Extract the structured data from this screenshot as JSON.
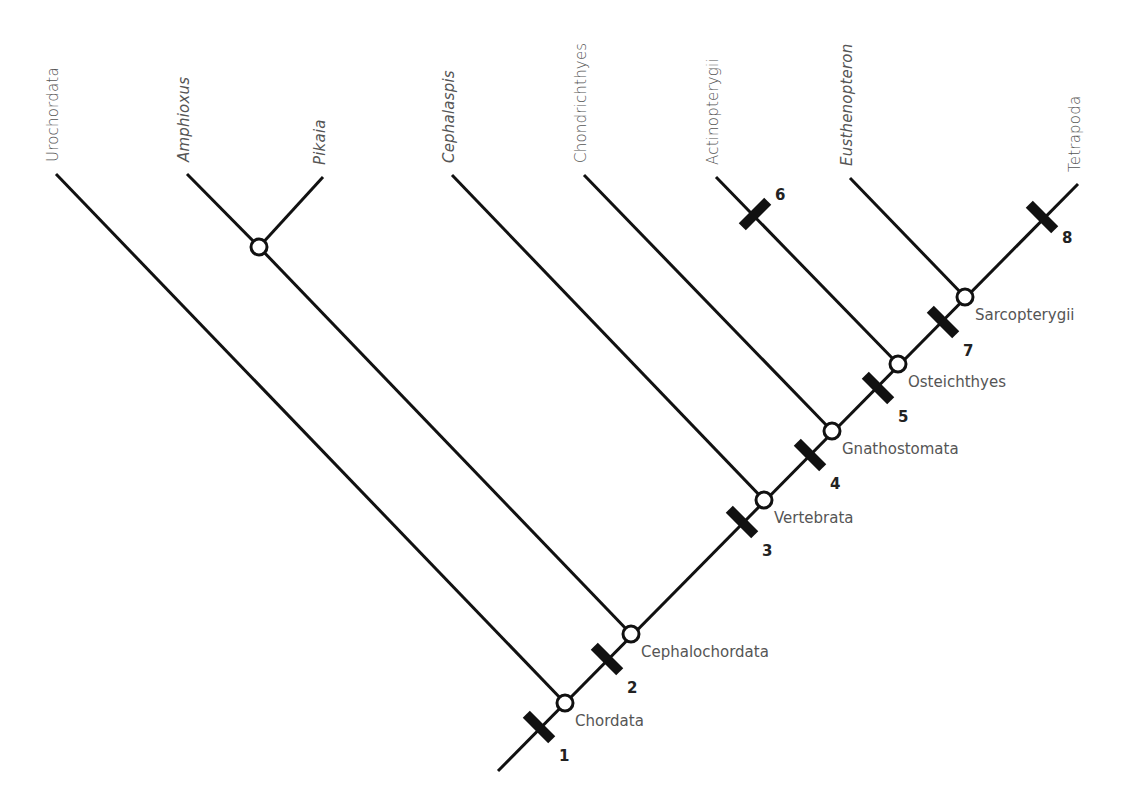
{
  "diagram": {
    "type": "cladogram",
    "taxa": [
      {
        "label": "Urochordata",
        "italic": false,
        "tip": [
          56,
          174
        ]
      },
      {
        "label": "Amphioxus",
        "italic": true,
        "tip": [
          187,
          174
        ]
      },
      {
        "label": "Pikaia",
        "italic": true,
        "tip": [
          323,
          177
        ]
      },
      {
        "label": "Cephalaspis",
        "italic": true,
        "tip": [
          452,
          175
        ]
      },
      {
        "label": "Chondrichthyes",
        "italic": false,
        "tip": [
          584,
          175
        ]
      },
      {
        "label": "Actinopterygii",
        "italic": false,
        "tip": [
          716,
          177
        ]
      },
      {
        "label": "Eusthenopteron",
        "italic": true,
        "tip": [
          850,
          178
        ]
      },
      {
        "label": "Tetrapoda",
        "italic": false,
        "tip": [
          1078,
          184
        ]
      }
    ],
    "root": [
      498,
      771
    ],
    "nodes": [
      {
        "label": "Chordata",
        "pos": [
          565,
          703
        ]
      },
      {
        "label": "Cephalochordata",
        "pos": [
          631,
          634
        ]
      },
      {
        "label": "Vertebrata",
        "pos": [
          764,
          500
        ]
      },
      {
        "label": "Gnathostomata",
        "pos": [
          832,
          431
        ]
      },
      {
        "label": "Osteichthyes",
        "pos": [
          898,
          364
        ]
      },
      {
        "label": "Sarcopterygii",
        "pos": [
          965,
          297
        ]
      }
    ],
    "side_node": {
      "pos": [
        259,
        247
      ]
    },
    "characters": [
      {
        "number": "1",
        "pos": [
          539,
          727
        ]
      },
      {
        "number": "2",
        "pos": [
          607,
          659
        ]
      },
      {
        "number": "3",
        "pos": [
          742,
          522
        ]
      },
      {
        "number": "4",
        "pos": [
          810,
          455
        ]
      },
      {
        "number": "5",
        "pos": [
          878,
          388
        ]
      },
      {
        "number": "6",
        "pos": [
          755,
          214
        ]
      },
      {
        "number": "7",
        "pos": [
          943,
          322
        ]
      },
      {
        "number": "8",
        "pos": [
          1042,
          217
        ]
      }
    ]
  }
}
